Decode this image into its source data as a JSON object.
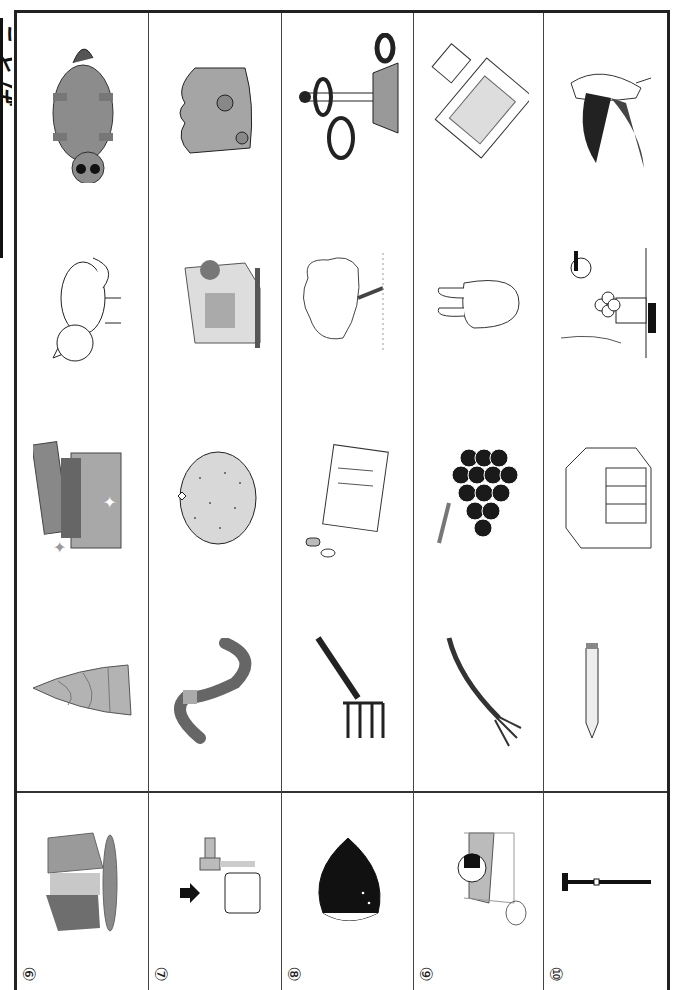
{
  "page": {
    "title_visible": "ことば",
    "orientation": "rotated-90"
  },
  "columns": [
    {
      "number": "⑥",
      "key_picture": "waterfall",
      "pictures": [
        "raccoon-dog",
        "fox",
        "treasure-box",
        "bamboo-shoot"
      ]
    },
    {
      "number": "⑦",
      "key_picture": "water-tap",
      "pictures": [
        "cheese",
        "sewing-machine",
        "mandarin-orange",
        "earthworm"
      ]
    },
    {
      "number": "⑧",
      "key_picture": "chestnut",
      "pictures": [
        "ring-toss",
        "cherry-tree",
        "medicine",
        "rake"
      ]
    },
    {
      "number": "⑨",
      "key_picture": "futon",
      "pictures": [
        "futon-mattress",
        "turnip",
        "grapes",
        "fork"
      ]
    },
    {
      "number": "⑩",
      "key_picture": "cane",
      "pictures": [
        "swallow",
        "moon-viewing",
        "desk",
        "pencil"
      ]
    }
  ],
  "colors": {
    "line": "#222222",
    "gray_fill": "#9a9a9a",
    "dark_fill": "#1a1a1a"
  }
}
